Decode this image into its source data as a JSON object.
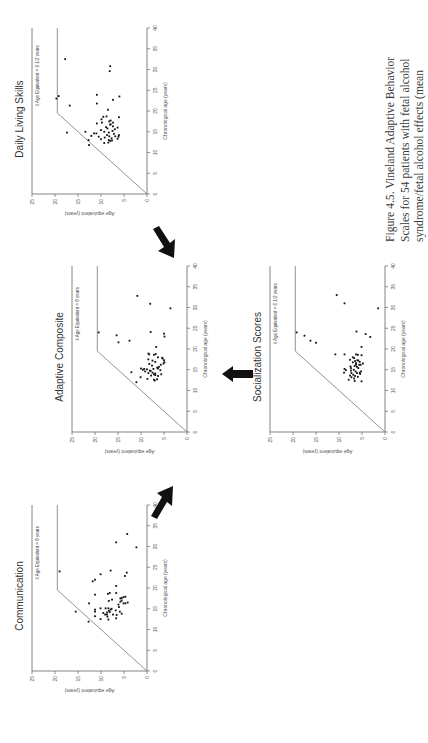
{
  "caption": {
    "lines": [
      "Figure 4.5.  Vineland Adaptive Behavior",
      "Scales for 54 patients with fetal alcohol",
      "syndrome/fetal alcohol effects (mean"
    ]
  },
  "axes": {
    "xlabel": "Chronological age (years)",
    "ylabel": "Age equivalent (years)",
    "xticks": [
      "0",
      "5",
      "10",
      "15",
      "20",
      "25",
      "30",
      "35",
      "40"
    ],
    "yticks": [
      "0",
      "5",
      "10",
      "15",
      "20",
      "25"
    ]
  },
  "chart_data": [
    {
      "type": "scatter",
      "title": "Daily Living Skills",
      "annotation": "x̄ Age Equivalent = 9 1/2 years",
      "xlabel": "Chronological age (years)",
      "ylabel": "Age equivalent (years)",
      "xlim": [
        0,
        40
      ],
      "ylim": [
        0,
        25
      ],
      "reference_line": [
        [
          0,
          0
        ],
        [
          19.5,
          19.5
        ],
        [
          40,
          19.5
        ]
      ],
      "points": [
        [
          23,
          19.7
        ],
        [
          23.6,
          19.2
        ],
        [
          32.5,
          17.8
        ],
        [
          21.3,
          16.8
        ],
        [
          14.8,
          17.4
        ],
        [
          15,
          13.4
        ],
        [
          13,
          12.7
        ],
        [
          11.8,
          12.6
        ],
        [
          14,
          12.1
        ],
        [
          14.6,
          11.5
        ],
        [
          14.6,
          11
        ],
        [
          17,
          10.9
        ],
        [
          21.8,
          10.9
        ],
        [
          23.9,
          10.9
        ],
        [
          13.8,
          10.5
        ],
        [
          13.2,
          10
        ],
        [
          15.4,
          10
        ],
        [
          18,
          9.9
        ],
        [
          17.2,
          9.8
        ],
        [
          18.6,
          9.5
        ],
        [
          12.3,
          9.3
        ],
        [
          13.6,
          9.2
        ],
        [
          15,
          9.3
        ],
        [
          14.2,
          8.7
        ],
        [
          16.1,
          8.9
        ],
        [
          18.7,
          8.8
        ],
        [
          20.3,
          8.5
        ],
        [
          12.4,
          8.4
        ],
        [
          13,
          8.3
        ],
        [
          13.9,
          8.2
        ],
        [
          14.8,
          8.3
        ],
        [
          12.8,
          8
        ],
        [
          16.7,
          8
        ],
        [
          17.5,
          8.2
        ],
        [
          30.8,
          8
        ],
        [
          29.6,
          8.1
        ],
        [
          17.7,
          7.9
        ],
        [
          13.4,
          7.7
        ],
        [
          15.2,
          7.5
        ],
        [
          16.3,
          7.4
        ],
        [
          17.2,
          7.4
        ],
        [
          22.7,
          7.4
        ],
        [
          13.9,
          6.9
        ],
        [
          15.6,
          7
        ],
        [
          13.3,
          6.4
        ],
        [
          13.8,
          6.2
        ],
        [
          16,
          6.4
        ],
        [
          18.5,
          6.1
        ],
        [
          23.5,
          6
        ],
        [
          14.2,
          6.1
        ],
        [
          16.8,
          7.9
        ],
        [
          14.5,
          7.2
        ],
        [
          12.9,
          7.6
        ],
        [
          15.8,
          8.6
        ]
      ]
    },
    {
      "type": "scatter",
      "title": "Adaptive  Composite",
      "annotation": "x̄ Age Equivalent = 8 years",
      "xlabel": "Chronological age (years)",
      "ylabel": "Age equivalent (years)",
      "xlim": [
        0,
        40
      ],
      "ylim": [
        0,
        25
      ],
      "reference_line": [
        [
          0,
          0
        ],
        [
          19.5,
          19.5
        ],
        [
          40,
          19.5
        ]
      ],
      "points": [
        [
          24,
          19.2
        ],
        [
          23.3,
          15.3
        ],
        [
          21.6,
          14.9
        ],
        [
          22,
          12.5
        ],
        [
          32.8,
          10.8
        ],
        [
          30.9,
          8
        ],
        [
          24.1,
          7.9
        ],
        [
          23.7,
          5
        ],
        [
          23,
          4.9
        ],
        [
          29.8,
          3.6
        ],
        [
          20.5,
          6.7
        ],
        [
          18.9,
          8.4
        ],
        [
          18.7,
          8.2
        ],
        [
          18.6,
          7.2
        ],
        [
          18.8,
          6.8
        ],
        [
          17.5,
          8.4
        ],
        [
          17.2,
          7.5
        ],
        [
          17.7,
          5.3
        ],
        [
          17.3,
          5
        ],
        [
          16.8,
          4.9
        ],
        [
          16.5,
          5.1
        ],
        [
          16.4,
          8.2
        ],
        [
          15.3,
          10
        ],
        [
          15.2,
          9.3
        ],
        [
          15,
          9.6
        ],
        [
          15.1,
          8.7
        ],
        [
          15.2,
          7.3
        ],
        [
          15.5,
          6.5
        ],
        [
          15.3,
          6.3
        ],
        [
          14.6,
          9.1
        ],
        [
          14.4,
          12.1
        ],
        [
          14.2,
          8.4
        ],
        [
          14.3,
          7.5
        ],
        [
          14.1,
          6.9
        ],
        [
          13.9,
          5.6
        ],
        [
          13.6,
          7.8
        ],
        [
          13.7,
          6.9
        ],
        [
          13.5,
          6.3
        ],
        [
          13.2,
          10.1
        ],
        [
          12.8,
          8.6
        ],
        [
          12.6,
          7.2
        ],
        [
          12.4,
          7
        ],
        [
          12,
          11
        ],
        [
          12.7,
          6.5
        ],
        [
          14.8,
          8.1
        ],
        [
          16,
          7.6
        ],
        [
          16.9,
          6.9
        ],
        [
          18,
          6.3
        ],
        [
          13.9,
          7.2
        ],
        [
          14.9,
          5.8
        ],
        [
          16.2,
          5.7
        ],
        [
          17.9,
          5.4
        ],
        [
          15.7,
          6.1
        ],
        [
          14.7,
          7.9
        ]
      ]
    },
    {
      "type": "scatter",
      "title": "Socialization Scores",
      "annotation": "x̄ Age Equivalent = 6 1/2 years",
      "xlabel": "Chronological age (years)",
      "ylabel": "Age equivalent (years)",
      "xlim": [
        0,
        40
      ],
      "ylim": [
        0,
        25
      ],
      "reference_line": [
        [
          0,
          0
        ],
        [
          19.5,
          19.5
        ],
        [
          40,
          19.5
        ]
      ],
      "points": [
        [
          24,
          19.2
        ],
        [
          23.2,
          17.5
        ],
        [
          22,
          16.2
        ],
        [
          21.5,
          15
        ],
        [
          33,
          10.5
        ],
        [
          31,
          8.8
        ],
        [
          29.8,
          1.5
        ],
        [
          24.2,
          6.2
        ],
        [
          23.6,
          4.2
        ],
        [
          22.9,
          3.2
        ],
        [
          20.5,
          5.1
        ],
        [
          18.7,
          10.8
        ],
        [
          18.7,
          8.8
        ],
        [
          18.7,
          6.3
        ],
        [
          18.6,
          5.9
        ],
        [
          18.5,
          5.1
        ],
        [
          18,
          7
        ],
        [
          17.8,
          6.7
        ],
        [
          17.4,
          7.6
        ],
        [
          17.3,
          6
        ],
        [
          17.2,
          5.8
        ],
        [
          16.8,
          7
        ],
        [
          16.6,
          6.3
        ],
        [
          16.5,
          4.8
        ],
        [
          16.2,
          6.3
        ],
        [
          16.2,
          5.6
        ],
        [
          16.2,
          5.3
        ],
        [
          15.8,
          7.5
        ],
        [
          15.7,
          6.1
        ],
        [
          15.4,
          7.4
        ],
        [
          15.4,
          5.8
        ],
        [
          15.2,
          8.8
        ],
        [
          15,
          6.8
        ],
        [
          14.9,
          8.5
        ],
        [
          14.8,
          7.4
        ],
        [
          14.6,
          6.4
        ],
        [
          14.6,
          5.2
        ],
        [
          14.3,
          8.9
        ],
        [
          14.2,
          7.3
        ],
        [
          14.2,
          6.1
        ],
        [
          14,
          5.4
        ],
        [
          13.8,
          6.9
        ],
        [
          13.6,
          7.6
        ],
        [
          13.5,
          6.5
        ],
        [
          13.3,
          5.9
        ],
        [
          13.2,
          7.3
        ],
        [
          12.9,
          6.7
        ],
        [
          12.6,
          7.9
        ],
        [
          12.3,
          6.6
        ],
        [
          12.2,
          5.1
        ],
        [
          17.1,
          6.5
        ],
        [
          15.9,
          6.6
        ],
        [
          14.3,
          5.5
        ],
        [
          16.9,
          5.5
        ]
      ]
    },
    {
      "type": "scatter",
      "title": "Communication",
      "annotation": "x̄ Age Equivalent = 8 years",
      "xlabel": "Chronological age (years)",
      "ylabel": "Age equivalent (years)",
      "xlim": [
        0,
        40
      ],
      "ylim": [
        0,
        25
      ],
      "reference_line": [
        [
          0,
          0
        ],
        [
          19.5,
          19.5
        ],
        [
          40,
          19.5
        ]
      ],
      "points": [
        [
          24,
          19
        ],
        [
          14.3,
          15.5
        ],
        [
          11.9,
          12.7
        ],
        [
          16.3,
          12.6
        ],
        [
          21.6,
          11.8
        ],
        [
          22,
          11.3
        ],
        [
          18.4,
          11.3
        ],
        [
          14.8,
          11.3
        ],
        [
          14.3,
          11.3
        ],
        [
          13.2,
          11.3
        ],
        [
          15.1,
          10.1
        ],
        [
          12.5,
          10.1
        ],
        [
          23.3,
          10.1
        ],
        [
          14,
          9.5
        ],
        [
          13.6,
          9.1
        ],
        [
          15.1,
          9
        ],
        [
          14.1,
          8.7
        ],
        [
          13.6,
          8.7
        ],
        [
          13.1,
          8.6
        ],
        [
          12.4,
          8.4
        ],
        [
          14.5,
          8.3
        ],
        [
          14.2,
          8.1
        ],
        [
          15.1,
          8.4
        ],
        [
          14.8,
          7.9
        ],
        [
          16.9,
          8.3
        ],
        [
          18.6,
          8.5
        ],
        [
          18.8,
          8.1
        ],
        [
          24.2,
          7.9
        ],
        [
          13.6,
          7.4
        ],
        [
          15,
          7.7
        ],
        [
          13.5,
          6.6
        ],
        [
          12.7,
          6.7
        ],
        [
          18.8,
          6.7
        ],
        [
          20.5,
          6.7
        ],
        [
          31,
          6.7
        ],
        [
          16.7,
          5.8
        ],
        [
          17.5,
          5.8
        ],
        [
          17.6,
          5.5
        ],
        [
          17,
          5.5
        ],
        [
          16.3,
          5.1
        ],
        [
          17.8,
          5.1
        ],
        [
          17.9,
          4.7
        ],
        [
          16.3,
          4.7
        ],
        [
          16.5,
          4.2
        ],
        [
          22.9,
          4.8
        ],
        [
          23.7,
          4.4
        ],
        [
          33,
          4.3
        ],
        [
          29.8,
          2.3
        ],
        [
          14.3,
          5.9
        ],
        [
          15.4,
          6.1
        ],
        [
          13.8,
          5.5
        ],
        [
          17.2,
          7.6
        ],
        [
          16,
          6.2
        ],
        [
          14.6,
          6.8
        ]
      ]
    }
  ]
}
